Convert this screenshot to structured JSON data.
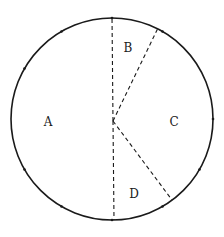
{
  "diagram": {
    "type": "circle-sectors",
    "stroke_color": "#1a1a1a",
    "background": "#ffffff",
    "circle": {
      "cx": 112,
      "cy": 119,
      "r": 101
    },
    "center_point": {
      "x": 113,
      "y": 121
    },
    "radii": [
      {
        "name": "radius-top",
        "x2": 112,
        "y2": 16
      },
      {
        "name": "radius-bottom",
        "x2": 114,
        "y2": 220
      },
      {
        "name": "radius-upper-right",
        "x2": 158,
        "y2": 28
      },
      {
        "name": "radius-lower-right",
        "x2": 172,
        "y2": 200
      }
    ],
    "regions": [
      {
        "label": "A",
        "x": 48,
        "y": 126
      },
      {
        "label": "B",
        "x": 128,
        "y": 52
      },
      {
        "label": "C",
        "x": 174,
        "y": 126
      },
      {
        "label": "D",
        "x": 134,
        "y": 198
      }
    ],
    "tick_marks_deg": [
      0,
      60,
      90,
      120,
      150,
      210,
      240,
      270,
      300,
      330
    ]
  }
}
